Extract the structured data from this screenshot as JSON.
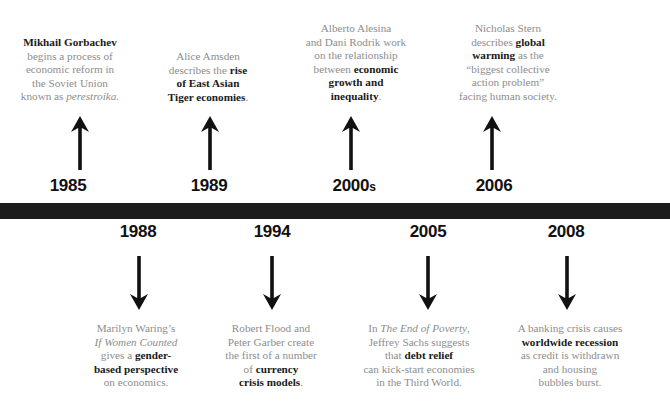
{
  "graphic": {
    "type": "timeline",
    "title_visible": false,
    "bar_color": "#1c1c1c",
    "body_text_color": "#8d8d8d",
    "highlight_text_color": "#1a1a1a",
    "background": "#ffffff"
  },
  "events_above": [
    {
      "year": "1985",
      "year_suffix": "",
      "arrow": "up-arrow-icon",
      "lines": [
        [
          {
            "t": "Mikhail Gorbachev",
            "s": "bold"
          }
        ],
        [
          {
            "t": "begins a process of",
            "s": "normal"
          }
        ],
        [
          {
            "t": "economic reform in",
            "s": "normal"
          }
        ],
        [
          {
            "t": "the Soviet Union",
            "s": "normal"
          }
        ],
        [
          {
            "t": "known as ",
            "s": "normal"
          },
          {
            "t": "perestroika",
            "s": "italic"
          },
          {
            "t": ".",
            "s": "normal"
          }
        ]
      ]
    },
    {
      "year": "1989",
      "year_suffix": "",
      "arrow": "up-arrow-icon",
      "lines": [
        [
          {
            "t": "Alice Amsden",
            "s": "normal"
          }
        ],
        [
          {
            "t": "describes the ",
            "s": "normal"
          },
          {
            "t": "rise",
            "s": "bold"
          }
        ],
        [
          {
            "t": "of East Asian",
            "s": "bold"
          }
        ],
        [
          {
            "t": "Tiger economies",
            "s": "bold"
          },
          {
            "t": ".",
            "s": "normal"
          }
        ]
      ]
    },
    {
      "year": "2000",
      "year_suffix": "s",
      "arrow": "up-arrow-icon",
      "lines": [
        [
          {
            "t": "Alberto Alesina",
            "s": "normal"
          }
        ],
        [
          {
            "t": "and Dani Rodrik work",
            "s": "normal"
          }
        ],
        [
          {
            "t": "on the relationship",
            "s": "normal"
          }
        ],
        [
          {
            "t": "between ",
            "s": "normal"
          },
          {
            "t": "economic",
            "s": "bold"
          }
        ],
        [
          {
            "t": "growth and",
            "s": "bold"
          }
        ],
        [
          {
            "t": "inequality",
            "s": "bold"
          },
          {
            "t": ".",
            "s": "normal"
          }
        ]
      ]
    },
    {
      "year": "2006",
      "year_suffix": "",
      "arrow": "up-arrow-icon",
      "lines": [
        [
          {
            "t": "Nicholas Stern",
            "s": "normal"
          }
        ],
        [
          {
            "t": "describes ",
            "s": "normal"
          },
          {
            "t": "global",
            "s": "bold"
          }
        ],
        [
          {
            "t": "warming",
            "s": "bold"
          },
          {
            "t": " as the",
            "s": "normal"
          }
        ],
        [
          {
            "t": "“biggest collective",
            "s": "normal"
          }
        ],
        [
          {
            "t": "action problem”",
            "s": "normal"
          }
        ],
        [
          {
            "t": "facing human society.",
            "s": "normal"
          }
        ]
      ]
    }
  ],
  "events_below": [
    {
      "year": "1988",
      "year_suffix": "",
      "arrow": "down-arrow-icon",
      "lines": [
        [
          {
            "t": "Marilyn Waring’s",
            "s": "normal"
          }
        ],
        [
          {
            "t": "If Women Counted",
            "s": "italic"
          }
        ],
        [
          {
            "t": "gives a ",
            "s": "normal"
          },
          {
            "t": "gender-",
            "s": "bold"
          }
        ],
        [
          {
            "t": "based perspective",
            "s": "bold"
          }
        ],
        [
          {
            "t": "on economics.",
            "s": "normal"
          }
        ]
      ]
    },
    {
      "year": "1994",
      "year_suffix": "",
      "arrow": "down-arrow-icon",
      "lines": [
        [
          {
            "t": "Robert Flood and",
            "s": "normal"
          }
        ],
        [
          {
            "t": "Peter Garber create",
            "s": "normal"
          }
        ],
        [
          {
            "t": "the first of a number",
            "s": "normal"
          }
        ],
        [
          {
            "t": "of ",
            "s": "normal"
          },
          {
            "t": "currency",
            "s": "bold"
          }
        ],
        [
          {
            "t": "crisis models",
            "s": "bold"
          },
          {
            "t": ".",
            "s": "normal"
          }
        ]
      ]
    },
    {
      "year": "2005",
      "year_suffix": "",
      "arrow": "down-arrow-icon",
      "lines": [
        [
          {
            "t": "In ",
            "s": "normal"
          },
          {
            "t": "The End of Poverty",
            "s": "italic"
          },
          {
            "t": ",",
            "s": "normal"
          }
        ],
        [
          {
            "t": "Jeffrey Sachs suggests",
            "s": "normal"
          }
        ],
        [
          {
            "t": "that ",
            "s": "normal"
          },
          {
            "t": "debt relief",
            "s": "bold"
          }
        ],
        [
          {
            "t": "can kick-start economies",
            "s": "normal"
          }
        ],
        [
          {
            "t": "in the Third World.",
            "s": "normal"
          }
        ]
      ]
    },
    {
      "year": "2008",
      "year_suffix": "",
      "arrow": "down-arrow-icon",
      "lines": [
        [
          {
            "t": "A banking crisis causes",
            "s": "normal"
          }
        ],
        [
          {
            "t": "worldwide recession",
            "s": "bold"
          }
        ],
        [
          {
            "t": "as credit is withdrawn",
            "s": "normal"
          }
        ],
        [
          {
            "t": "and housing",
            "s": "normal"
          }
        ],
        [
          {
            "t": "bubbles burst.",
            "s": "normal"
          }
        ]
      ]
    }
  ]
}
